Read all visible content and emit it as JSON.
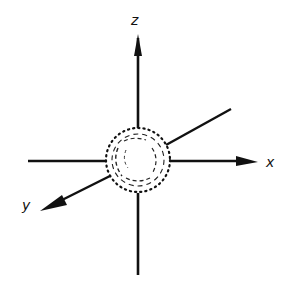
{
  "diagram": {
    "type": "3d-coordinate-axes",
    "origin_object": "sphere",
    "axes": {
      "x": {
        "label": "x"
      },
      "y": {
        "label": "y"
      },
      "z": {
        "label": "z"
      }
    },
    "colors": {
      "line": "#111111",
      "background": "#ffffff"
    }
  }
}
